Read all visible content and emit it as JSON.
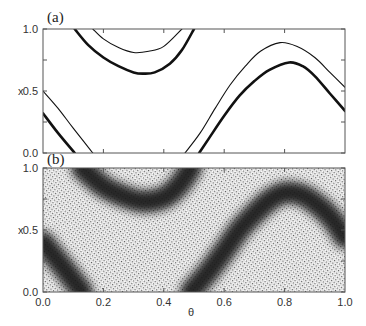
{
  "chart_data": [
    {
      "panel": "(a)",
      "type": "line",
      "title": "",
      "xlabel": "",
      "ylabel": "x",
      "xlim": [
        0.0,
        1.0
      ],
      "ylim": [
        0.0,
        1.0
      ],
      "yticks": [
        "0.0",
        "0.5",
        "1.0"
      ],
      "xticks": [],
      "grid": false,
      "legend": null,
      "series": [
        {
          "name": "thick curve (mod 1)",
          "style": "thick",
          "points": [
            [
              0.0,
              0.32
            ],
            [
              0.05,
              0.16
            ],
            [
              0.105,
              0.0
            ],
            [
              0.105,
              1.0
            ],
            [
              0.15,
              0.87
            ],
            [
              0.2,
              0.77
            ],
            [
              0.25,
              0.7
            ],
            [
              0.3,
              0.65
            ],
            [
              0.33,
              0.64
            ],
            [
              0.37,
              0.65
            ],
            [
              0.42,
              0.72
            ],
            [
              0.46,
              0.83
            ],
            [
              0.5,
              1.0
            ],
            [
              0.517,
              0.0
            ],
            [
              0.55,
              0.12
            ],
            [
              0.6,
              0.3
            ],
            [
              0.65,
              0.46
            ],
            [
              0.7,
              0.58
            ],
            [
              0.75,
              0.67
            ],
            [
              0.815,
              0.73
            ],
            [
              0.86,
              0.7
            ],
            [
              0.9,
              0.62
            ],
            [
              0.95,
              0.48
            ],
            [
              1.0,
              0.34
            ]
          ]
        },
        {
          "name": "thin curve (mod 1)",
          "style": "thin",
          "points": [
            [
              0.0,
              0.5
            ],
            [
              0.05,
              0.36
            ],
            [
              0.1,
              0.2
            ],
            [
              0.165,
              0.0
            ],
            [
              0.165,
              1.0
            ],
            [
              0.2,
              0.92
            ],
            [
              0.25,
              0.85
            ],
            [
              0.3,
              0.81
            ],
            [
              0.35,
              0.82
            ],
            [
              0.4,
              0.86
            ],
            [
              0.46,
              1.0
            ],
            [
              0.47,
              0.0
            ],
            [
              0.52,
              0.16
            ],
            [
              0.57,
              0.36
            ],
            [
              0.62,
              0.55
            ],
            [
              0.67,
              0.7
            ],
            [
              0.72,
              0.82
            ],
            [
              0.785,
              0.89
            ],
            [
              0.84,
              0.86
            ],
            [
              0.9,
              0.77
            ],
            [
              0.95,
              0.65
            ],
            [
              1.0,
              0.53
            ]
          ]
        }
      ]
    },
    {
      "panel": "(b)",
      "type": "heatmap",
      "title": "",
      "xlabel": "θ",
      "ylabel": "x",
      "xlim": [
        0.0,
        1.0
      ],
      "ylim": [
        0.0,
        1.0
      ],
      "xticks": [
        "0.0",
        "0.2",
        "0.4",
        "0.6",
        "0.8",
        "1.0"
      ],
      "yticks": [
        "0.0",
        "0.5",
        "1.0"
      ],
      "grid": false,
      "description": "Dense stippled point density (dark band) following the same wavy path as panel (a); dark band centered between the two curves",
      "dark_band_centerline": [
        [
          0.0,
          0.4
        ],
        [
          0.06,
          0.22
        ],
        [
          0.13,
          0.0
        ],
        [
          0.13,
          1.0
        ],
        [
          0.2,
          0.85
        ],
        [
          0.27,
          0.77
        ],
        [
          0.33,
          0.73
        ],
        [
          0.4,
          0.76
        ],
        [
          0.45,
          0.86
        ],
        [
          0.49,
          1.0
        ],
        [
          0.49,
          0.0
        ],
        [
          0.55,
          0.17
        ],
        [
          0.6,
          0.33
        ],
        [
          0.65,
          0.5
        ],
        [
          0.7,
          0.63
        ],
        [
          0.75,
          0.74
        ],
        [
          0.8,
          0.8
        ],
        [
          0.86,
          0.78
        ],
        [
          0.92,
          0.68
        ],
        [
          0.96,
          0.58
        ],
        [
          1.0,
          0.44
        ]
      ],
      "band_half_width": 0.09
    }
  ],
  "labels": {
    "panel_a": "(a)",
    "panel_b": "(b)",
    "ylabel": "x",
    "xlabel": "θ",
    "y_1": "1.0",
    "y_05": "0.5",
    "y_0": "0.0"
  },
  "colors": {
    "axis": "#555555",
    "curve": "#111111",
    "band": "#1a1a1a",
    "stipple": "#444444",
    "background": "#ffffff"
  }
}
